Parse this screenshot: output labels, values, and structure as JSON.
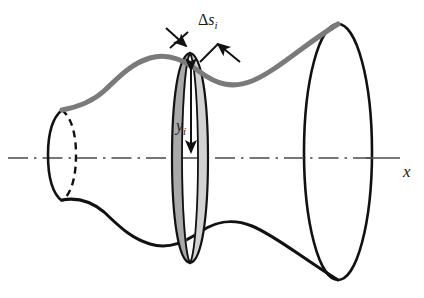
{
  "figure": {
    "kind": "surface-of-revolution-diagram",
    "caption": "",
    "background_color": "#ffffff",
    "width": 424,
    "height": 298
  },
  "colors": {
    "outline_black": "#111111",
    "generating_curve_gray": "#7a7a7a",
    "band_face_dark": "#a9a9a9",
    "band_face_light": "#d2d2d2",
    "axis_gray": "#4a4a4a",
    "label_color": "#1a1a1a"
  },
  "labels": {
    "axis": {
      "text": "x",
      "name": "x-axis-label",
      "x": 405,
      "y": 171,
      "font_size": 16,
      "italic": true
    },
    "band_width": {
      "delta": "Δ",
      "variable": "s",
      "subscript": "i",
      "text": "Δs_i",
      "name": "delta-s-i-label",
      "x": 204,
      "y": 24,
      "font_size": 15
    },
    "radius": {
      "variable": "y",
      "subscript": "i",
      "text": "y_i",
      "name": "y-i-label",
      "x": 182,
      "y": 127,
      "font_size": 15
    }
  },
  "geometry": {
    "axis": {
      "y": 158,
      "x_start": 8,
      "x_end": 400,
      "dash_pattern": "18 7 2 7",
      "solid_tail_from": 330,
      "stroke_width": 1.6
    },
    "left_cap": {
      "center_x": 62,
      "center_y": 155,
      "rx": 12,
      "ry": 45,
      "front_solid": true,
      "back_dashed": true,
      "dash_pattern": "7 5"
    },
    "right_cap": {
      "center_x": 338,
      "center_y": 152,
      "rx": 34,
      "ry": 128,
      "solid": true
    },
    "band": {
      "center_x": 190,
      "axis_y": 158,
      "outer_rx": 18,
      "outer_ry": 105,
      "inner_offset_x": 22,
      "slant_label": "Δs_i",
      "radius_label": "y_i",
      "radius_top_y": 62,
      "radius_bottom_y": 158
    },
    "profile_top_color": "#7a7a7a",
    "profile_bottom_color": "#111111"
  },
  "annotations": {
    "delta_s_arrows": [
      {
        "name": "delta-s-left-arrow",
        "from_x": 174,
        "from_y": 34,
        "to_x": 197,
        "to_y": 52
      },
      {
        "name": "delta-s-right-arrow",
        "from_x": 238,
        "from_y": 60,
        "to_x": 216,
        "to_y": 44
      }
    ],
    "radius_arrow": {
      "name": "y-i-double-arrow",
      "x": 191,
      "top_y": 66,
      "bottom_y": 156,
      "double_headed": true
    }
  }
}
